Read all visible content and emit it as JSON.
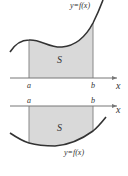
{
  "diagrams": [
    {
      "id": "top",
      "description": "Area S between y=f(x) (above x-axis) and x-axis from a to b",
      "curve_label": "y=f(x)",
      "region_label": "S",
      "axis_label": "x",
      "left_bound_label": "a",
      "right_bound_label": "b"
    },
    {
      "id": "bottom",
      "description": "Area S between y=f(x) (below x-axis) and x-axis from a to b",
      "curve_label": "y=f(x)",
      "region_label": "S",
      "axis_label": "x",
      "left_bound_label": "a",
      "right_bound_label": "b"
    }
  ],
  "colors": {
    "fill": "#d9d9d9",
    "curve": "#333333",
    "axis": "#777777",
    "bound": "#888888"
  }
}
